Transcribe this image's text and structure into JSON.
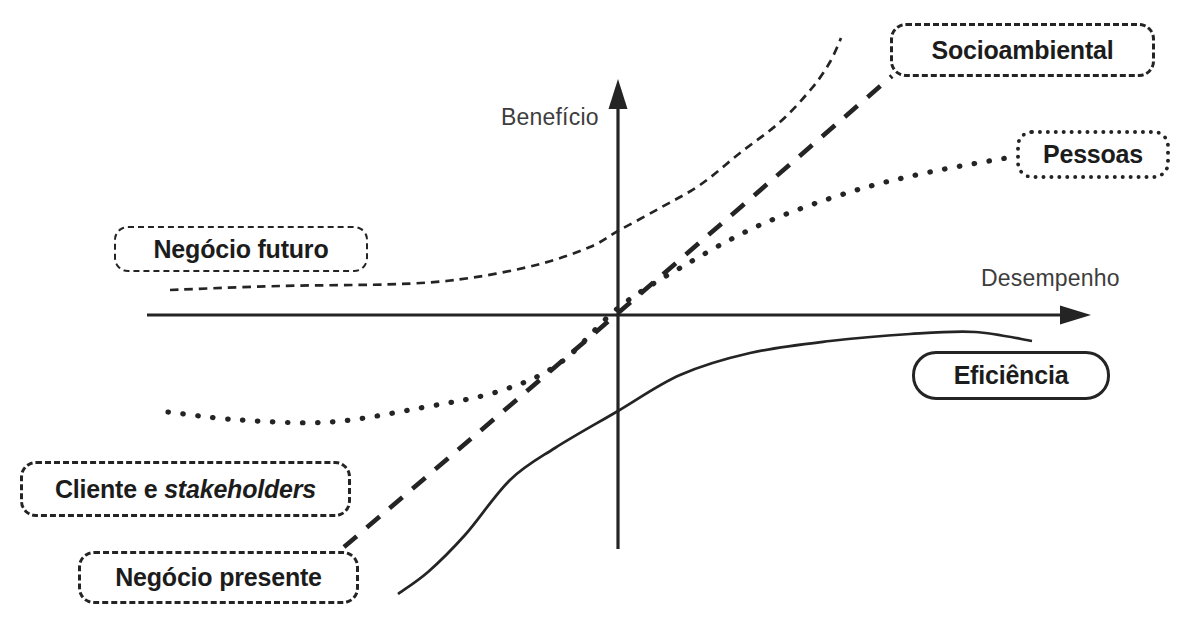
{
  "colors": {
    "ink": "#242424",
    "label_text": "#1c1c1c",
    "axis_text": "#3d3d3d",
    "background": "#ffffff"
  },
  "axes": {
    "y_label": "Benefício",
    "x_label": "Desempenho"
  },
  "callouts": {
    "socioambiental": {
      "label": "Socioambiental",
      "border": "dashed"
    },
    "pessoas": {
      "label": "Pessoas",
      "border": "dotted"
    },
    "negocio_futuro": {
      "label": "Negócio futuro",
      "border": "fine-dashed"
    },
    "eficiencia": {
      "label": "Eficiência",
      "border": "solid"
    },
    "cliente": {
      "label_prefix": "Cliente e ",
      "label_italic": "stakeholders",
      "border": "dashed"
    },
    "negocio_presente": {
      "label": "Negócio presente",
      "border": "dashed"
    }
  },
  "curves": [
    {
      "name": "negocio-futuro-curve",
      "stroke_style": "fine-dashed",
      "points": [
        [
          170,
          290
        ],
        [
          280,
          286
        ],
        [
          400,
          284
        ],
        [
          470,
          278
        ],
        [
          540,
          264
        ],
        [
          590,
          247
        ],
        [
          618,
          231
        ],
        [
          660,
          208
        ],
        [
          700,
          185
        ],
        [
          740,
          153
        ],
        [
          780,
          122
        ],
        [
          812,
          88
        ],
        [
          830,
          62
        ],
        [
          841,
          38
        ]
      ]
    },
    {
      "name": "socioambiental-curve",
      "stroke_style": "long-dashed",
      "points": [
        [
          344,
          547
        ],
        [
          618,
          313
        ],
        [
          892,
          76
        ]
      ]
    },
    {
      "name": "pessoas-curve",
      "stroke_style": "dotted",
      "points": [
        [
          168,
          412
        ],
        [
          240,
          420
        ],
        [
          330,
          422
        ],
        [
          420,
          408
        ],
        [
          500,
          391
        ],
        [
          560,
          363
        ],
        [
          618,
          308
        ],
        [
          680,
          268
        ],
        [
          760,
          225
        ],
        [
          850,
          192
        ],
        [
          930,
          172
        ],
        [
          1012,
          157
        ]
      ]
    },
    {
      "name": "eficiencia-curve",
      "stroke_style": "solid",
      "points": [
        [
          398,
          594
        ],
        [
          428,
          572
        ],
        [
          465,
          535
        ],
        [
          510,
          480
        ],
        [
          555,
          448
        ],
        [
          618,
          411
        ],
        [
          680,
          375
        ],
        [
          750,
          353
        ],
        [
          830,
          341
        ],
        [
          910,
          334
        ],
        [
          975,
          332
        ],
        [
          1032,
          341
        ]
      ]
    }
  ]
}
